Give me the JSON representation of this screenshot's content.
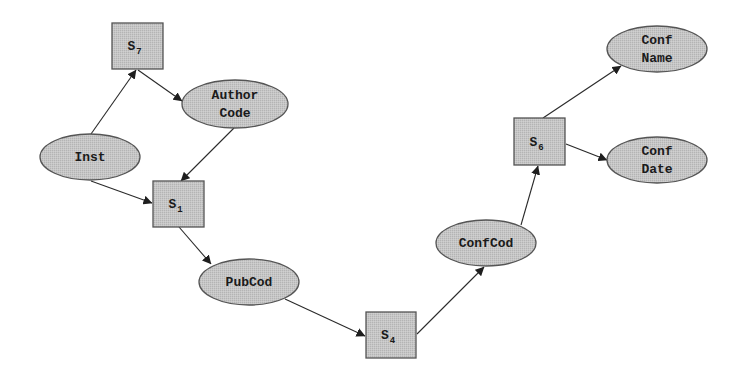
{
  "diagram": {
    "type": "directed-graph",
    "style": {
      "node_fill": "#c2c2c2",
      "node_stroke": "#555555",
      "edge_color": "#2a2a2a",
      "background": "#ffffff"
    },
    "nodes": [
      {
        "id": "S7",
        "shape": "box",
        "label": "S",
        "subscript": "7",
        "x": 112,
        "y": 23,
        "w": 51,
        "h": 46
      },
      {
        "id": "AuthorCode",
        "shape": "ellipse",
        "lines": [
          "Author",
          "Code"
        ],
        "cx": 235,
        "cy": 104,
        "rx": 53,
        "ry": 24
      },
      {
        "id": "Inst",
        "shape": "ellipse",
        "lines": [
          "Inst"
        ],
        "cx": 90,
        "cy": 157,
        "rx": 50,
        "ry": 23
      },
      {
        "id": "S1",
        "shape": "box",
        "label": "S",
        "subscript": "1",
        "x": 153,
        "y": 181,
        "w": 51,
        "h": 46
      },
      {
        "id": "PubCod",
        "shape": "ellipse",
        "lines": [
          "PubCod"
        ],
        "cx": 249,
        "cy": 282,
        "rx": 50,
        "ry": 23
      },
      {
        "id": "S4",
        "shape": "box",
        "label": "S",
        "subscript": "4",
        "x": 366,
        "y": 312,
        "w": 50,
        "h": 46
      },
      {
        "id": "ConfCod",
        "shape": "ellipse",
        "lines": [
          "ConfCod"
        ],
        "cx": 486,
        "cy": 243,
        "rx": 50,
        "ry": 23
      },
      {
        "id": "S6",
        "shape": "box",
        "label": "S",
        "subscript": "6",
        "x": 514,
        "y": 118,
        "w": 51,
        "h": 47
      },
      {
        "id": "ConfName",
        "shape": "ellipse",
        "lines": [
          "Conf",
          "Name"
        ],
        "cx": 657,
        "cy": 49,
        "rx": 50,
        "ry": 23
      },
      {
        "id": "ConfDate",
        "shape": "ellipse",
        "lines": [
          "Conf",
          "Date"
        ],
        "cx": 657,
        "cy": 160,
        "rx": 50,
        "ry": 23
      }
    ],
    "edges": [
      {
        "from": "Inst",
        "to": "S7",
        "x1": 91,
        "y1": 134,
        "x2": 136,
        "y2": 70
      },
      {
        "from": "S7",
        "to": "AuthorCode",
        "x1": 138,
        "y1": 70,
        "x2": 182,
        "y2": 101
      },
      {
        "from": "AuthorCode",
        "to": "S1",
        "x1": 234,
        "y1": 128,
        "x2": 181,
        "y2": 181
      },
      {
        "from": "Inst",
        "to": "S1",
        "x1": 91,
        "y1": 181,
        "x2": 152,
        "y2": 203
      },
      {
        "from": "S1",
        "to": "PubCod",
        "x1": 179,
        "y1": 227,
        "x2": 211,
        "y2": 264
      },
      {
        "from": "PubCod",
        "to": "S4",
        "x1": 285,
        "y1": 299,
        "x2": 365,
        "y2": 336
      },
      {
        "from": "S4",
        "to": "ConfCod",
        "x1": 417,
        "y1": 334,
        "x2": 484,
        "y2": 267
      },
      {
        "from": "ConfCod",
        "to": "S6",
        "x1": 521,
        "y1": 225,
        "x2": 538,
        "y2": 166
      },
      {
        "from": "S6",
        "to": "ConfName",
        "x1": 543,
        "y1": 118,
        "x2": 621,
        "y2": 66
      },
      {
        "from": "S6",
        "to": "ConfDate",
        "x1": 566,
        "y1": 144,
        "x2": 607,
        "y2": 160
      }
    ]
  }
}
